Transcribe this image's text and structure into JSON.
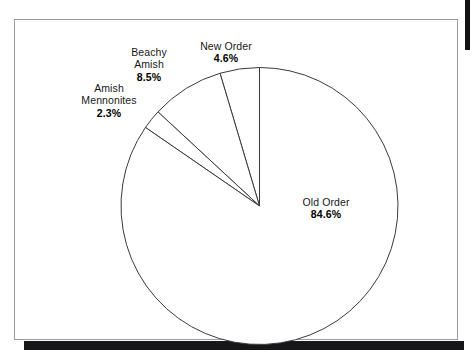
{
  "figure": {
    "frame_color": "#9a9a9a",
    "shadow_color": "#17171a",
    "background": "#ffffff",
    "stroke_color": "#3a3a3a"
  },
  "chart_data": {
    "type": "pie",
    "title": "",
    "subtitle": "",
    "xlabel": "",
    "ylabel": "",
    "legend_position": "none",
    "grid": false,
    "start_angle_deg": 90,
    "direction": "counterclockwise",
    "units": "percent",
    "categories": [
      "New Order",
      "Beachy Amish",
      "Amish Mennonites",
      "Old Order"
    ],
    "values": [
      4.6,
      8.5,
      2.3,
      84.6
    ],
    "slices": [
      {
        "name": "New Order",
        "label_line_1": "New Order",
        "label_line_2": "4.6%",
        "value": 4.6,
        "value_text": "4.6%",
        "color": "#ffffff",
        "stroke": "#3a3a3a"
      },
      {
        "name": "Beachy Amish",
        "label_line_1": "Beachy",
        "label_line_2": "Amish",
        "label_line_3": "8.5%",
        "value": 8.5,
        "value_text": "8.5%",
        "color": "#ffffff",
        "stroke": "#3a3a3a"
      },
      {
        "name": "Amish Mennonites",
        "label_line_1": "Amish",
        "label_line_2": "Mennonites",
        "label_line_3": "2.3%",
        "value": 2.3,
        "value_text": "2.3%",
        "color": "#ffffff",
        "stroke": "#3a3a3a"
      },
      {
        "name": "Old Order",
        "label_line_1": "Old Order",
        "label_line_2": "84.6%",
        "value": 84.6,
        "value_text": "84.6%",
        "color": "#ffffff",
        "stroke": "#3a3a3a"
      }
    ]
  }
}
